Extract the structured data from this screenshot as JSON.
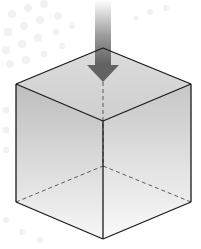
{
  "diagram": {
    "background_color": "#ffffff",
    "background_dots_color": "#f2f2f2",
    "arrow": {
      "direction": "down",
      "color_top": "#ffffff",
      "color_bottom": "#6a6a6a"
    },
    "cube": {
      "edge_color": "#1a1a1a",
      "hidden_edge_color": "#555555",
      "top_face_color": "#d6d6d6",
      "left_face_top_color": "#bdbdbd",
      "left_face_bottom_color": "#f7f7f7",
      "right_face_top_color": "#c6c6c6",
      "right_face_bottom_color": "#f9f9f9"
    }
  }
}
